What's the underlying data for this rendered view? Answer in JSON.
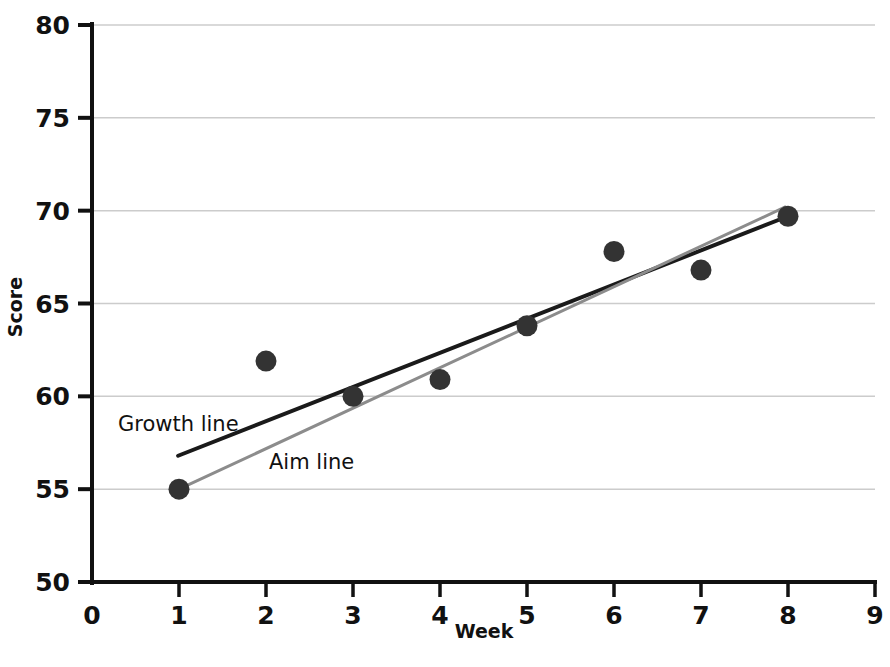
{
  "chart_data": {
    "type": "scatter",
    "title": "",
    "xlabel": "Week",
    "ylabel": "Score",
    "xlim": [
      0,
      9
    ],
    "ylim": [
      50,
      80
    ],
    "xticks": [
      "0",
      "1",
      "2",
      "3",
      "4",
      "5",
      "6",
      "7",
      "8",
      "9"
    ],
    "yticks": [
      "50",
      "55",
      "60",
      "65",
      "70",
      "75",
      "80"
    ],
    "grid": "horizontal",
    "legend_position": "inline-annotations",
    "series": [
      {
        "name": "Data points",
        "kind": "scatter",
        "marker": "filled-circle",
        "color": "#333333",
        "x": [
          1,
          2,
          3,
          4,
          5,
          6,
          7,
          8
        ],
        "values": [
          55.0,
          61.9,
          60.0,
          60.9,
          63.8,
          67.8,
          66.8,
          69.7
        ]
      },
      {
        "name": "Growth line",
        "kind": "line",
        "color": "#1a1a1a",
        "width": 4,
        "x": [
          0.99,
          8.0
        ],
        "values": [
          56.8,
          69.7
        ]
      },
      {
        "name": "Aim line",
        "kind": "line",
        "color": "#8c8c8c",
        "width": 3,
        "x": [
          1.0,
          7.97
        ],
        "values": [
          55.0,
          70.2
        ]
      }
    ],
    "annotations": [
      {
        "text": "Growth line",
        "x_px": 118,
        "y_px": 431
      },
      {
        "text": "Aim line",
        "x_px": 269,
        "y_px": 469
      }
    ],
    "axis_color": "#111111",
    "grid_color": "#cccccc",
    "background": "#ffffff"
  }
}
